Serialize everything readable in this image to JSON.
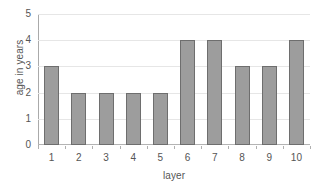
{
  "chart_data": {
    "type": "bar",
    "title": "",
    "categories": [
      "1",
      "2",
      "3",
      "4",
      "5",
      "6",
      "7",
      "8",
      "9",
      "10"
    ],
    "values": [
      3,
      2,
      2,
      2,
      2,
      4,
      4,
      3,
      3,
      4
    ],
    "xlabel": "layer",
    "ylabel": "age in years",
    "ylim": [
      0,
      5
    ],
    "yticks": [
      "5",
      "4",
      "3",
      "2",
      "1",
      "0"
    ],
    "ytick_values": [
      5,
      4,
      3,
      2,
      1,
      0
    ],
    "grid": true,
    "legend": false,
    "colors": {
      "bar_fill": "#9d9d9d",
      "bar_border": "#6e6e6e",
      "gridline": "#e6e6e6",
      "axis": "#aaaaaa",
      "text": "#555555",
      "background": "#ffffff"
    }
  }
}
